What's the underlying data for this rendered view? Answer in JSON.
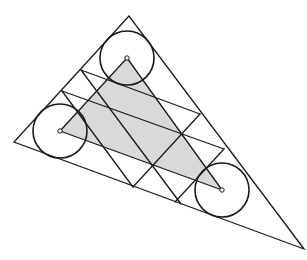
{
  "diagram": {
    "width": 307,
    "height": 260,
    "colors": {
      "line": "#1a1a1a",
      "shade": "#d9d9d9",
      "background": "#ffffff",
      "dot_fill": "#ffffff"
    },
    "outer_triangle": {
      "vertices": [
        [
          129,
          16
        ],
        [
          14,
          142
        ],
        [
          304,
          249
        ]
      ]
    },
    "inner_triangle": {
      "vertices": [
        [
          127,
          58
        ],
        [
          60,
          131
        ],
        [
          222,
          190
        ]
      ],
      "shaded": true
    },
    "circles": [
      {
        "cx": 127,
        "cy": 58,
        "r": 27
      },
      {
        "cx": 60,
        "cy": 131,
        "r": 27
      },
      {
        "cx": 222,
        "cy": 190,
        "r": 27
      }
    ],
    "grid_lines": [
      {
        "name": "parallel-bc-1",
        "x1": 81,
        "y1": 70,
        "x2": 200,
        "y2": 114
      },
      {
        "name": "parallel-bc-2",
        "x1": 62,
        "y1": 91,
        "x2": 224,
        "y2": 149
      },
      {
        "name": "parallel-ac-1",
        "x1": 81,
        "y1": 70,
        "x2": 181,
        "y2": 204
      },
      {
        "name": "parallel-ac-2",
        "x1": 62,
        "y1": 91,
        "x2": 133,
        "y2": 187
      },
      {
        "name": "parallel-ab-1",
        "x1": 200,
        "y1": 114,
        "x2": 133,
        "y2": 187
      },
      {
        "name": "parallel-ab-2",
        "x1": 224,
        "y1": 149,
        "x2": 175,
        "y2": 202
      },
      {
        "name": "inner-side-pq",
        "x1": 127,
        "y1": 58,
        "x2": 60,
        "y2": 131
      },
      {
        "name": "inner-side-qr",
        "x1": 60,
        "y1": 131,
        "x2": 222,
        "y2": 190
      },
      {
        "name": "inner-side-pr",
        "x1": 127,
        "y1": 58,
        "x2": 222,
        "y2": 190
      }
    ]
  }
}
